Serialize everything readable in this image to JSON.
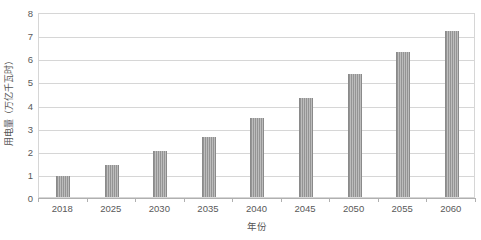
{
  "chart_data": {
    "type": "bar",
    "title": "",
    "subtitle": "",
    "xlabel": "年份",
    "ylabel": "用电量（万亿千瓦时）",
    "categories": [
      "2018",
      "2025",
      "2030",
      "2035",
      "2040",
      "2045",
      "2050",
      "2055",
      "2060"
    ],
    "values": [
      0.9,
      1.4,
      2.0,
      2.6,
      3.4,
      4.3,
      5.3,
      6.25,
      7.2
    ],
    "series": [
      {
        "name": "用电量",
        "values": [
          0.9,
          1.4,
          2.0,
          2.6,
          3.4,
          4.3,
          5.3,
          6.25,
          7.2
        ],
        "color": "#949494"
      }
    ],
    "ylim": [
      0,
      8
    ],
    "ytick_values": [
      0,
      1,
      2,
      3,
      4,
      5,
      6,
      7,
      8
    ],
    "ytick_labels": [
      "0",
      "1",
      "2",
      "3",
      "4",
      "5",
      "6",
      "7",
      "8"
    ],
    "grid": true,
    "grid_axis": "y",
    "grid_color": "#d6d6d6",
    "legend": false,
    "legend_position": "none",
    "plot_border_color": "#d6d6d6",
    "axis_color": "#b0b0b0",
    "text_color": "#595959",
    "background_color": "#ffffff"
  }
}
